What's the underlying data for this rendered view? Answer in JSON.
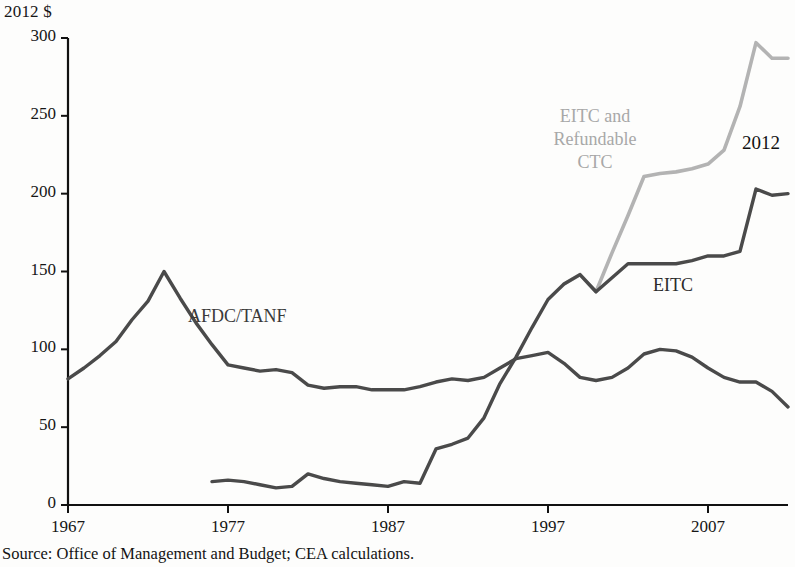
{
  "figure": {
    "unit_label": "2012 $",
    "source_note": "Source: Office of Management and Budget; CEA calculations.",
    "end_year_label": "2012"
  },
  "labels": {
    "afdc": "AFDC/TANF",
    "eitc": "EITC",
    "eitc_ctc_line1": "EITC and",
    "eitc_ctc_line2": "Refundable",
    "eitc_ctc_line3": "CTC"
  },
  "colors": {
    "afdc_line": "#4a4a4a",
    "eitc_line": "#4a4a4a",
    "eitc_ctc_line": "#b3b3b3",
    "axis": "#111111",
    "text": "#161616"
  },
  "chart_data": {
    "type": "line",
    "title": "",
    "xlabel": "",
    "ylabel": "2012 $",
    "xlim": [
      1967,
      2012
    ],
    "ylim": [
      0,
      300
    ],
    "yticks": [
      0,
      50,
      100,
      150,
      200,
      250,
      300
    ],
    "xticks": [
      1967,
      1977,
      1987,
      1997,
      2007
    ],
    "grid": false,
    "legend_position": "inline-annotations",
    "annotations": [
      {
        "text": "AFDC/TANF",
        "x": 1975,
        "y": 118,
        "color": "#3a3a3a"
      },
      {
        "text": "EITC",
        "x": 2004,
        "y": 178,
        "color": "#2b2b2b"
      },
      {
        "text": "EITC and Refundable CTC",
        "x": 1999,
        "y": 240,
        "color": "#a8a8a8"
      },
      {
        "text": "2012",
        "x": 2012,
        "y": 245,
        "color": "#111111"
      }
    ],
    "series": [
      {
        "name": "AFDC/TANF",
        "color": "#4a4a4a",
        "x": [
          1967,
          1968,
          1969,
          1970,
          1971,
          1972,
          1973,
          1974,
          1975,
          1976,
          1977,
          1978,
          1979,
          1980,
          1981,
          1982,
          1983,
          1984,
          1985,
          1986,
          1987,
          1988,
          1989,
          1990,
          1991,
          1992,
          1993,
          1994,
          1995,
          1996,
          1997,
          1998,
          1999,
          2000,
          2001,
          2002,
          2003,
          2004,
          2005,
          2006,
          2007,
          2008,
          2009,
          2010,
          2011,
          2012
        ],
        "values": [
          81,
          88,
          96,
          105,
          119,
          131,
          150,
          133,
          117,
          103,
          90,
          88,
          86,
          87,
          85,
          77,
          75,
          76,
          76,
          74,
          74,
          74,
          76,
          79,
          81,
          80,
          82,
          88,
          94,
          96,
          98,
          91,
          82,
          80,
          82,
          88,
          97,
          100,
          99,
          95,
          88,
          82,
          79,
          79,
          73,
          63
        ]
      },
      {
        "name": "EITC",
        "color": "#4a4a4a",
        "x": [
          1976,
          1977,
          1978,
          1979,
          1980,
          1981,
          1982,
          1983,
          1984,
          1985,
          1986,
          1987,
          1988,
          1989,
          1990,
          1991,
          1992,
          1993,
          1994,
          1995,
          1996,
          1997,
          1998,
          1999,
          2000,
          2001,
          2002,
          2003,
          2004,
          2005,
          2006,
          2007,
          2008,
          2009,
          2010,
          2011,
          2012
        ],
        "values": [
          15,
          16,
          15,
          13,
          11,
          12,
          20,
          17,
          15,
          14,
          13,
          12,
          15,
          14,
          36,
          39,
          43,
          56,
          78,
          95,
          114,
          132,
          142,
          148,
          137,
          146,
          155,
          155,
          155,
          155,
          157,
          160,
          160,
          163,
          203,
          199,
          200
        ]
      },
      {
        "name": "EITC and Refundable CTC",
        "color": "#b3b3b3",
        "x": [
          1998,
          1999,
          2000,
          2001,
          2002,
          2003,
          2004,
          2005,
          2006,
          2007,
          2008,
          2009,
          2010,
          2011,
          2012
        ],
        "values": [
          142,
          148,
          137,
          162,
          186,
          211,
          213,
          214,
          216,
          219,
          228,
          256,
          297,
          287,
          287
        ]
      }
    ]
  }
}
